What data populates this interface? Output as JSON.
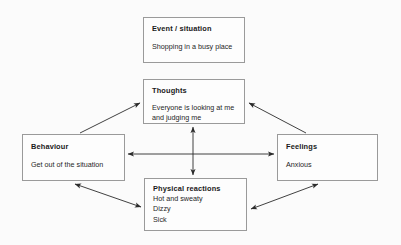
{
  "diagram": {
    "type": "cbt-cycle-diagram",
    "background_color": "#fbfbfb",
    "box_border_color": "#9a9a9a",
    "arrow_color": "#2b2b2b",
    "text_color": "#1a1a1a",
    "nodes": [
      {
        "id": "event",
        "title": "Event / situation",
        "lines": [
          "Shopping in a busy place"
        ]
      },
      {
        "id": "thoughts",
        "title": "Thoughts",
        "lines": [
          "Everyone is looking at me",
          "and judging me"
        ]
      },
      {
        "id": "behaviour",
        "title": "Behaviour",
        "lines": [
          "Get out of the situation"
        ]
      },
      {
        "id": "feelings",
        "title": "Feelings",
        "lines": [
          "Anxious"
        ]
      },
      {
        "id": "physical",
        "title": "Physical reactions",
        "lines": [
          "Hot and sweaty",
          "Dizzy",
          "Sick"
        ]
      }
    ],
    "arrows": [
      {
        "id": "behaviour-to-thoughts",
        "from": "behaviour",
        "to": "thoughts",
        "heads": "single",
        "direction": "up-right"
      },
      {
        "id": "feelings-to-thoughts",
        "from": "feelings",
        "to": "thoughts",
        "heads": "single",
        "direction": "up-left"
      },
      {
        "id": "behaviour-feelings",
        "from": "behaviour",
        "to": "feelings",
        "heads": "double",
        "direction": "horizontal"
      },
      {
        "id": "thoughts-physical",
        "from": "thoughts",
        "to": "physical",
        "heads": "double",
        "direction": "vertical"
      },
      {
        "id": "behaviour-physical",
        "from": "behaviour",
        "to": "physical",
        "heads": "double",
        "direction": "diagonal-down-right"
      },
      {
        "id": "physical-feelings",
        "from": "physical",
        "to": "feelings",
        "heads": "double",
        "direction": "diagonal-up-right"
      }
    ]
  }
}
